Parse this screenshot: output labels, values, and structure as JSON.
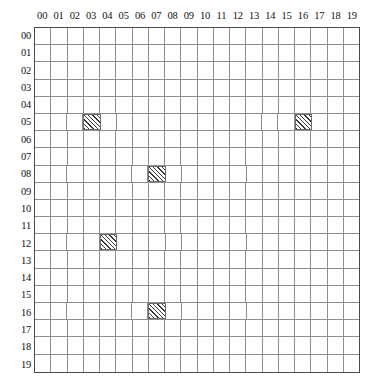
{
  "figure": {
    "name": "occupancy-grid",
    "type": "grid-map",
    "rows": 20,
    "cols": 20,
    "grid_line_color": "#8e8e8e",
    "border_color": "#4a4a4a",
    "hatch_color": "#3a3a3a",
    "background_color": "#ffffff"
  },
  "axes": {
    "column_labels": [
      "00",
      "01",
      "02",
      "03",
      "04",
      "05",
      "06",
      "07",
      "08",
      "09",
      "10",
      "11",
      "12",
      "13",
      "14",
      "15",
      "16",
      "17",
      "18",
      "19"
    ],
    "row_labels": [
      "00",
      "01",
      "02",
      "03",
      "04",
      "05",
      "06",
      "07",
      "08",
      "09",
      "10",
      "11",
      "12",
      "13",
      "14",
      "15",
      "16",
      "17",
      "18",
      "19"
    ]
  },
  "chart_data": {
    "type": "heatmap",
    "title": "",
    "xlabel": "",
    "ylabel": "",
    "categories": [
      "00",
      "01",
      "02",
      "03",
      "04",
      "05",
      "06",
      "07",
      "08",
      "09",
      "10",
      "11",
      "12",
      "13",
      "14",
      "15",
      "16",
      "17",
      "18",
      "19"
    ],
    "row_categories": [
      "00",
      "01",
      "02",
      "03",
      "04",
      "05",
      "06",
      "07",
      "08",
      "09",
      "10",
      "11",
      "12",
      "13",
      "14",
      "15",
      "16",
      "17",
      "18",
      "19"
    ],
    "grid": true,
    "legend": "none",
    "value_meaning": {
      "0": "empty cell",
      "1": "hatched / occupied cell"
    },
    "filled_cells": [
      {
        "row": 5,
        "col": 3,
        "row_label": "05",
        "col_label": "03"
      },
      {
        "row": 5,
        "col": 16,
        "row_label": "05",
        "col_label": "16"
      },
      {
        "row": 8,
        "col": 7,
        "row_label": "08",
        "col_label": "07"
      },
      {
        "row": 12,
        "col": 4,
        "row_label": "12",
        "col_label": "04"
      },
      {
        "row": 16,
        "col": 7,
        "row_label": "16",
        "col_label": "07"
      }
    ],
    "filled_count": 5,
    "total_cells": 400,
    "values": [
      [
        0,
        0,
        0,
        0,
        0,
        0,
        0,
        0,
        0,
        0,
        0,
        0,
        0,
        0,
        0,
        0,
        0,
        0,
        0,
        0
      ],
      [
        0,
        0,
        0,
        0,
        0,
        0,
        0,
        0,
        0,
        0,
        0,
        0,
        0,
        0,
        0,
        0,
        0,
        0,
        0,
        0
      ],
      [
        0,
        0,
        0,
        0,
        0,
        0,
        0,
        0,
        0,
        0,
        0,
        0,
        0,
        0,
        0,
        0,
        0,
        0,
        0,
        0
      ],
      [
        0,
        0,
        0,
        0,
        0,
        0,
        0,
        0,
        0,
        0,
        0,
        0,
        0,
        0,
        0,
        0,
        0,
        0,
        0,
        0
      ],
      [
        0,
        0,
        0,
        0,
        0,
        0,
        0,
        0,
        0,
        0,
        0,
        0,
        0,
        0,
        0,
        0,
        0,
        0,
        0,
        0
      ],
      [
        0,
        0,
        0,
        1,
        0,
        0,
        0,
        0,
        0,
        0,
        0,
        0,
        0,
        0,
        0,
        0,
        1,
        0,
        0,
        0
      ],
      [
        0,
        0,
        0,
        0,
        0,
        0,
        0,
        0,
        0,
        0,
        0,
        0,
        0,
        0,
        0,
        0,
        0,
        0,
        0,
        0
      ],
      [
        0,
        0,
        0,
        0,
        0,
        0,
        0,
        0,
        0,
        0,
        0,
        0,
        0,
        0,
        0,
        0,
        0,
        0,
        0,
        0
      ],
      [
        0,
        0,
        0,
        0,
        0,
        0,
        0,
        1,
        0,
        0,
        0,
        0,
        0,
        0,
        0,
        0,
        0,
        0,
        0,
        0
      ],
      [
        0,
        0,
        0,
        0,
        0,
        0,
        0,
        0,
        0,
        0,
        0,
        0,
        0,
        0,
        0,
        0,
        0,
        0,
        0,
        0
      ],
      [
        0,
        0,
        0,
        0,
        0,
        0,
        0,
        0,
        0,
        0,
        0,
        0,
        0,
        0,
        0,
        0,
        0,
        0,
        0,
        0
      ],
      [
        0,
        0,
        0,
        0,
        0,
        0,
        0,
        0,
        0,
        0,
        0,
        0,
        0,
        0,
        0,
        0,
        0,
        0,
        0,
        0
      ],
      [
        0,
        0,
        0,
        0,
        1,
        0,
        0,
        0,
        0,
        0,
        0,
        0,
        0,
        0,
        0,
        0,
        0,
        0,
        0,
        0
      ],
      [
        0,
        0,
        0,
        0,
        0,
        0,
        0,
        0,
        0,
        0,
        0,
        0,
        0,
        0,
        0,
        0,
        0,
        0,
        0,
        0
      ],
      [
        0,
        0,
        0,
        0,
        0,
        0,
        0,
        0,
        0,
        0,
        0,
        0,
        0,
        0,
        0,
        0,
        0,
        0,
        0,
        0
      ],
      [
        0,
        0,
        0,
        0,
        0,
        0,
        0,
        0,
        0,
        0,
        0,
        0,
        0,
        0,
        0,
        0,
        0,
        0,
        0,
        0
      ],
      [
        0,
        0,
        0,
        0,
        0,
        0,
        0,
        1,
        0,
        0,
        0,
        0,
        0,
        0,
        0,
        0,
        0,
        0,
        0,
        0
      ],
      [
        0,
        0,
        0,
        0,
        0,
        0,
        0,
        0,
        0,
        0,
        0,
        0,
        0,
        0,
        0,
        0,
        0,
        0,
        0,
        0
      ],
      [
        0,
        0,
        0,
        0,
        0,
        0,
        0,
        0,
        0,
        0,
        0,
        0,
        0,
        0,
        0,
        0,
        0,
        0,
        0,
        0
      ],
      [
        0,
        0,
        0,
        0,
        0,
        0,
        0,
        0,
        0,
        0,
        0,
        0,
        0,
        0,
        0,
        0,
        0,
        0,
        0,
        0
      ]
    ]
  }
}
